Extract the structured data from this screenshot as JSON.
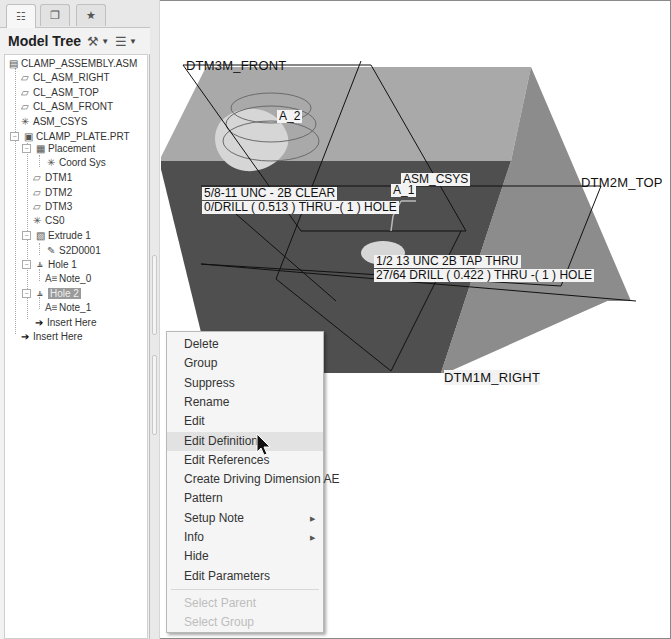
{
  "panel": {
    "tabs": [
      {
        "name": "model-tree-tab",
        "icon": "model-tree-icon",
        "glyph": "☷"
      },
      {
        "name": "folder-browser-tab",
        "icon": "folder-browser-icon",
        "glyph": "❐"
      },
      {
        "name": "favorites-tab",
        "icon": "favorites-icon",
        "glyph": "★"
      }
    ],
    "title": "Model Tree",
    "settings_icon_glyph": "⚒",
    "show_icon_glyph": "☰",
    "caret_glyph": "▼"
  },
  "tree": {
    "items": [
      {
        "label": "CLAMP_ASSEMBLY.ASM",
        "icon": "assembly-icon",
        "glyph": "▤"
      },
      {
        "label": "CL_ASM_RIGHT",
        "icon": "datum-plane-icon",
        "glyph": "▱"
      },
      {
        "label": "CL_ASM_TOP",
        "icon": "datum-plane-icon",
        "glyph": "▱"
      },
      {
        "label": "CL_ASM_FRONT",
        "icon": "datum-plane-icon",
        "glyph": "▱"
      },
      {
        "label": "ASM_CSYS",
        "icon": "csys-icon",
        "glyph": "✳"
      },
      {
        "label": "CLAMP_PLATE.PRT",
        "icon": "part-icon",
        "glyph": "▣"
      },
      {
        "label": "Placement",
        "icon": "placement-icon",
        "glyph": "▦"
      },
      {
        "label": "Coord Sys",
        "icon": "csys-icon",
        "glyph": "✳"
      },
      {
        "label": "DTM1",
        "icon": "datum-plane-icon",
        "glyph": "▱"
      },
      {
        "label": "DTM2",
        "icon": "datum-plane-icon",
        "glyph": "▱"
      },
      {
        "label": "DTM3",
        "icon": "datum-plane-icon",
        "glyph": "▱"
      },
      {
        "label": "CS0",
        "icon": "csys-icon",
        "glyph": "✳"
      },
      {
        "label": "Extrude 1",
        "icon": "extrude-icon",
        "glyph": "▧"
      },
      {
        "label": "S2D0001",
        "icon": "sketch-icon",
        "glyph": "✎"
      },
      {
        "label": "Hole 1",
        "icon": "hole-icon",
        "glyph": "⫨"
      },
      {
        "label": "Note_0",
        "icon": "note-icon",
        "glyph": "A≡"
      },
      {
        "label": "Hole 2",
        "icon": "hole-icon",
        "glyph": "⫨",
        "selected": true
      },
      {
        "label": "Note_1",
        "icon": "note-icon",
        "glyph": "A≡"
      },
      {
        "label": "Insert Here",
        "icon": "insert-here-icon",
        "glyph": "➔"
      },
      {
        "label": "Insert Here",
        "icon": "insert-here-icon",
        "glyph": "➔"
      }
    ]
  },
  "graphics": {
    "datums": {
      "front": "DTM3M_FRONT",
      "top": "DTM2M_TOP",
      "right": "DTM1M_RIGHT",
      "csys": "ASM_CSYS"
    },
    "axes": {
      "a1": "A_1",
      "a2": "A_2"
    },
    "notes": {
      "hole1_line1": "5/8-11 UNC - 2B CLEAR",
      "hole1_line2": "0/DRILL ( 0.513 )  THRU  -( 1 ) HOLE",
      "hole2_line1": "1/2 13 UNC   2B TAP  THRU",
      "hole2_line2": "27/64 DRILL ( 0.422 )  THRU  -( 1 ) HOLE"
    },
    "colors": {
      "top_face": "#a9a9a9",
      "front_face": "#4f4f4f",
      "side_face": "#8c8c8c",
      "hole_highlight": "#d6d6d6"
    }
  },
  "context_menu": {
    "items": [
      {
        "label": "Delete",
        "enabled": true
      },
      {
        "label": "Group",
        "enabled": true
      },
      {
        "label": "Suppress",
        "enabled": true
      },
      {
        "label": "Rename",
        "enabled": true
      },
      {
        "label": "Edit",
        "enabled": true
      },
      {
        "label": "Edit Definition",
        "enabled": true,
        "hover": true
      },
      {
        "label": "Edit References",
        "enabled": true
      },
      {
        "label": "Create Driving Dimension AE",
        "enabled": true
      },
      {
        "label": "Pattern",
        "enabled": true
      },
      {
        "label": "Setup Note",
        "enabled": true,
        "submenu": true
      },
      {
        "label": "Info",
        "enabled": true,
        "submenu": true
      },
      {
        "label": "Hide",
        "enabled": true
      },
      {
        "label": "Edit Parameters",
        "enabled": true
      },
      {
        "label": "Select Parent",
        "enabled": false
      },
      {
        "label": "Select Group",
        "enabled": false
      }
    ],
    "submenu_arrow_glyph": "▶"
  }
}
